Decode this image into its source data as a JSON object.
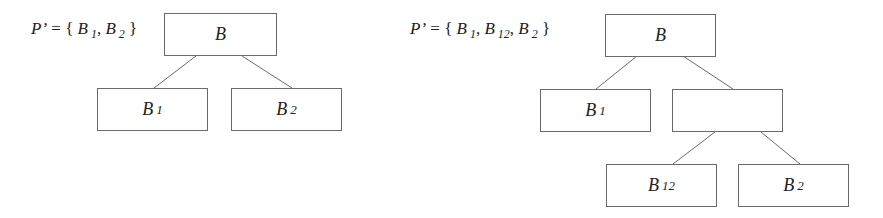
{
  "diagrams": [
    {
      "partition_label": {
        "prefix": "P’",
        "equals": " = { ",
        "items": [
          {
            "base": "B",
            "sub": "1"
          },
          {
            "base": "B",
            "sub": "2"
          }
        ],
        "close": " }"
      },
      "nodes": {
        "root": {
          "base": "B",
          "sub": ""
        },
        "left": {
          "base": "B",
          "sub": "1"
        },
        "right": {
          "base": "B",
          "sub": "2"
        }
      }
    },
    {
      "partition_label": {
        "prefix": "P’",
        "equals": " = { ",
        "items": [
          {
            "base": "B",
            "sub": "1"
          },
          {
            "base": "B",
            "sub": "12"
          },
          {
            "base": "B",
            "sub": "2"
          }
        ],
        "close": " }"
      },
      "nodes": {
        "root": {
          "base": "B",
          "sub": ""
        },
        "left": {
          "base": "B",
          "sub": "1"
        },
        "mid": {
          "base": "",
          "sub": ""
        },
        "mid_left": {
          "base": "B",
          "sub": "12"
        },
        "mid_right": {
          "base": "B",
          "sub": "2"
        }
      }
    }
  ],
  "separator": ", "
}
